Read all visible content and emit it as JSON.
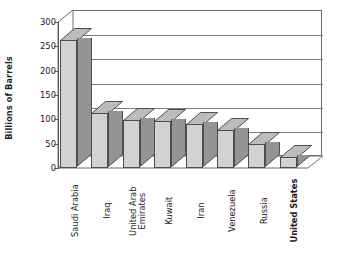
{
  "chart_data": {
    "type": "bar",
    "title": "",
    "subtitle": "",
    "xlabel": "",
    "ylabel": "Billions of Barrels",
    "categories": [
      "Saudi Arabia",
      "Iraq",
      "United Arab Emirates",
      "Kuwait",
      "Iran",
      "Venezuela",
      "Russia",
      "United States"
    ],
    "values": [
      262,
      113,
      98,
      97,
      90,
      78,
      49,
      22
    ],
    "ylim": [
      0,
      300
    ],
    "ytick_labels": [
      "300",
      "250",
      "200",
      "150",
      "100",
      "50",
      "0"
    ],
    "ytick_values": [
      300,
      250,
      200,
      150,
      100,
      50,
      0
    ],
    "ystep": 50,
    "grid": "horizontal",
    "legend": "none",
    "style": "3d-column",
    "emphasized_categories": [
      "United States"
    ],
    "colors": {
      "bar_front": "#d2d2d2",
      "bar_side": "#949494",
      "bar_top": "#bcbcbc",
      "bar_outline": "#4d4d4d",
      "gridline": "#7d7d7d",
      "axis": "#5a5a5a",
      "background": "#ffffff",
      "text": "#1a1a1a"
    }
  },
  "axis": {
    "y_title": "Billions of Barrels"
  },
  "category_labels": [
    {
      "line1": "Saudi Arabia",
      "line2": ""
    },
    {
      "line1": "Iraq",
      "line2": ""
    },
    {
      "line1": "United Arab",
      "line2": "Emirates"
    },
    {
      "line1": "Kuwait",
      "line2": ""
    },
    {
      "line1": "Iran",
      "line2": ""
    },
    {
      "line1": "Venezuela",
      "line2": ""
    },
    {
      "line1": "Russia",
      "line2": ""
    },
    {
      "line1": "United States",
      "line2": ""
    }
  ]
}
